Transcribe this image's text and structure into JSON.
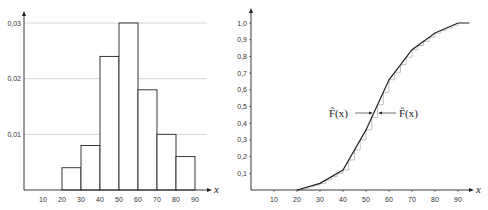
{
  "chart_data": [
    {
      "type": "bar",
      "title": "",
      "xlabel": "x",
      "ylabel": "",
      "bins": [
        [
          20,
          30
        ],
        [
          30,
          40
        ],
        [
          40,
          50
        ],
        [
          50,
          60
        ],
        [
          60,
          70
        ],
        [
          70,
          80
        ],
        [
          80,
          90
        ]
      ],
      "values": [
        0.004,
        0.008,
        0.024,
        0.03,
        0.018,
        0.01,
        0.006
      ],
      "x_ticks": [
        "10",
        "20",
        "30",
        "40",
        "50",
        "60",
        "70",
        "80",
        "90"
      ],
      "y_ticks": [
        "0,01",
        "0,02",
        "0,03"
      ],
      "y_tick_values": [
        0.01,
        0.02,
        0.03
      ],
      "ylim": [
        0,
        0.03
      ],
      "xlim": [
        0,
        95
      ],
      "grid": "horizontal dotted at y ticks"
    },
    {
      "type": "line",
      "title": "",
      "xlabel": "x",
      "ylabel": "",
      "series": [
        {
          "name": "F̃(x)",
          "x": [
            20,
            30,
            40,
            50,
            60,
            70,
            80,
            90,
            95
          ],
          "values": [
            0,
            0.04,
            0.12,
            0.36,
            0.66,
            0.84,
            0.94,
            1.0,
            1.0
          ]
        },
        {
          "name": "F̂(x)",
          "style": "step (empirical)",
          "x": [
            20,
            30,
            40,
            50,
            60,
            70,
            80,
            90
          ],
          "values": [
            0,
            0.04,
            0.12,
            0.36,
            0.66,
            0.84,
            0.94,
            1.0
          ]
        }
      ],
      "x_ticks": [
        "10",
        "20",
        "30",
        "40",
        "50",
        "60",
        "70",
        "80",
        "90"
      ],
      "y_ticks": [
        "0,1",
        "0,2",
        "0,3",
        "0,4",
        "0,5",
        "0,6",
        "0,7",
        "0,8",
        "0,9",
        "1,0"
      ],
      "ylim": [
        0,
        1.0
      ],
      "xlim": [
        0,
        95
      ],
      "annotations": [
        {
          "text": "F̃(x)",
          "arrow": "right",
          "target": "polygon"
        },
        {
          "text": "F̂(x)",
          "arrow": "left",
          "target": "step"
        }
      ]
    }
  ],
  "labels": {
    "left_x_axis": "x",
    "right_x_axis": "x",
    "anno_left": "F̃(x)",
    "anno_right": "F̂(x)"
  }
}
